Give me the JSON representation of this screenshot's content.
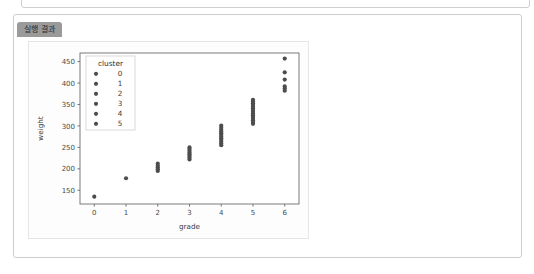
{
  "window": {
    "tab_label": "실행 결과"
  },
  "chart_data": {
    "type": "scatter",
    "title": "",
    "xlabel": "grade",
    "ylabel": "weight",
    "xlim": [
      -0.45,
      6.45
    ],
    "ylim": [
      118,
      470
    ],
    "xticks": [
      "0",
      "1",
      "2",
      "3",
      "4",
      "5",
      "6"
    ],
    "xtick_values": [
      0,
      1,
      2,
      3,
      4,
      5,
      6
    ],
    "yticks": [
      "150",
      "200",
      "250",
      "300",
      "350",
      "400",
      "450"
    ],
    "ytick_values": [
      150,
      200,
      250,
      300,
      350,
      400,
      450
    ],
    "grid": false,
    "legend": {
      "title": "cluster",
      "position": "upper left",
      "entries": [
        "0",
        "1",
        "2",
        "3",
        "4",
        "5"
      ]
    },
    "marker_color": "#4d4d4d",
    "marker_size": 2.1,
    "series": [
      {
        "name": "cluster 0",
        "x": [
          0
        ],
        "y": [
          135
        ]
      },
      {
        "name": "cluster 1",
        "x": [
          1
        ],
        "y": [
          178
        ]
      },
      {
        "name": "cluster 2",
        "x": [
          2,
          2,
          2,
          2,
          2
        ],
        "y": [
          195,
          199,
          203,
          207,
          212
        ]
      },
      {
        "name": "cluster 3",
        "x": [
          3,
          3,
          3,
          3,
          3,
          3,
          3,
          3
        ],
        "y": [
          222,
          226,
          230,
          234,
          238,
          242,
          246,
          250
        ]
      },
      {
        "name": "cluster 4",
        "x": [
          4,
          4,
          4,
          4,
          4,
          4,
          4,
          4,
          4,
          4,
          4,
          4
        ],
        "y": [
          255,
          259,
          263,
          267,
          271,
          275,
          279,
          283,
          287,
          291,
          296,
          301
        ]
      },
      {
        "name": "cluster 5",
        "x": [
          5,
          5,
          5,
          5,
          5,
          5,
          5,
          5,
          5,
          5,
          5,
          5,
          5,
          5,
          5
        ],
        "y": [
          305,
          309,
          313,
          317,
          321,
          325,
          329,
          333,
          337,
          341,
          345,
          349,
          353,
          357,
          361
        ]
      },
      {
        "name": "cluster 6",
        "x": [
          6,
          6,
          6,
          6,
          6
        ],
        "y": [
          382,
          387,
          392,
          408,
          425
        ]
      },
      {
        "name": "cluster 6 high",
        "x": [
          6
        ],
        "y": [
          457
        ]
      }
    ]
  }
}
